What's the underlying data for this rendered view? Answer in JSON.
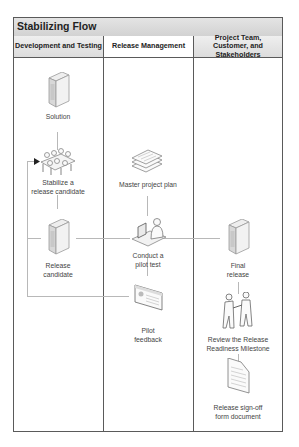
{
  "diagram": {
    "title": "Stabilizing Flow",
    "lanes": [
      {
        "label": "Development and Testing"
      },
      {
        "label": "Release Management"
      },
      {
        "label": "Project Team, Customer, and Stakeholders"
      }
    ],
    "nodes": {
      "solution": {
        "label": "Solution",
        "icon": "server-icon"
      },
      "stabilize": {
        "label_line1": "Stabilize a",
        "label_line2": "release candidate",
        "icon": "team-meeting-icon"
      },
      "release_candidate": {
        "label_line1": "Release",
        "label_line2": "candidate",
        "icon": "server-icon"
      },
      "master_plan": {
        "label": "Master project plan",
        "icon": "document-stack-icon"
      },
      "pilot_test": {
        "label_line1": "Conduct a",
        "label_line2": "pilot test",
        "icon": "person-at-computer-icon"
      },
      "pilot_feedback": {
        "label_line1": "Pilot",
        "label_line2": "feedback",
        "icon": "window-report-icon"
      },
      "final_release": {
        "label_line1": "Final",
        "label_line2": "release",
        "icon": "server-icon"
      },
      "review_milestone": {
        "label_line1": "Review the Release",
        "label_line2": "Readiness Milestone",
        "icon": "handshake-icon"
      },
      "signoff_doc": {
        "label_line1": "Release sign-off",
        "label_line2": "form document",
        "icon": "document-icon"
      }
    },
    "colors": {
      "border": "#5a5a5a",
      "header_bg": "#d9d9d9",
      "connector": "#b8b8b8",
      "text": "#444444"
    }
  }
}
